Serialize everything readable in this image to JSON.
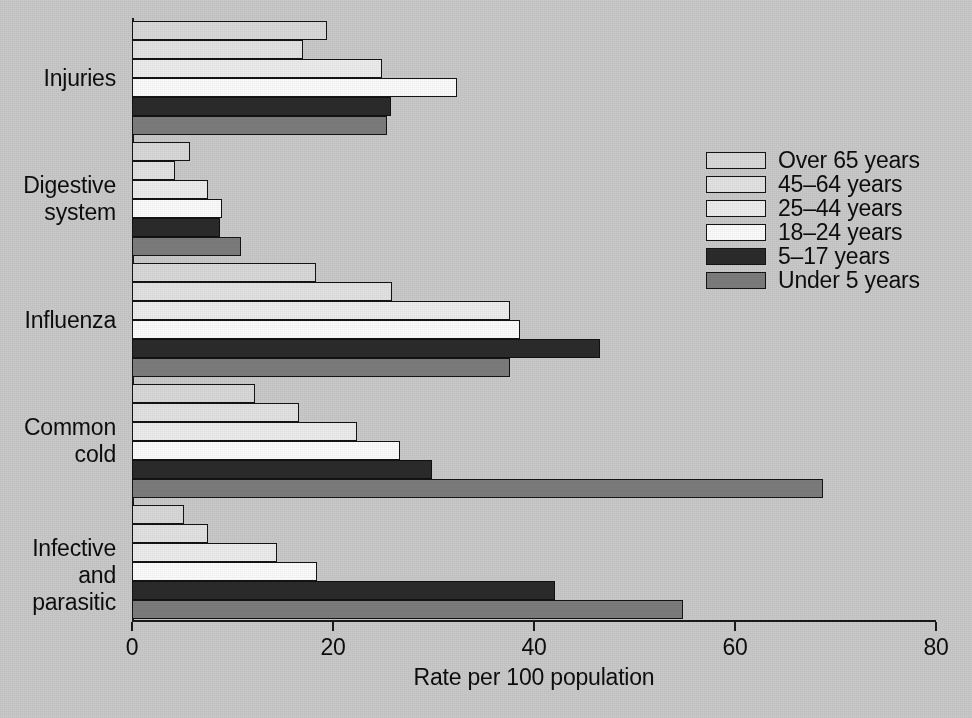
{
  "chart_data": {
    "type": "bar",
    "orientation": "horizontal",
    "title": "",
    "xlabel": "Rate per 100 population",
    "ylabel": "",
    "xlim": [
      0,
      80
    ],
    "xticks": [
      0,
      20,
      40,
      60,
      80
    ],
    "xtick_labels": [
      "0",
      "20",
      "40",
      "60",
      "80"
    ],
    "grid": false,
    "legend_position": "right",
    "categories": [
      "Injuries",
      "Digestive system",
      "Influenza",
      "Common cold",
      "Infective and parasitic"
    ],
    "category_label_lines": [
      [
        "Injuries"
      ],
      [
        "Digestive",
        "system"
      ],
      [
        "Influenza"
      ],
      [
        "Common",
        "cold"
      ],
      [
        "Infective and",
        "parasitic"
      ]
    ],
    "series": [
      {
        "name": "Over 65 years",
        "color": "#d8d8d8",
        "values": [
          19.4,
          5.8,
          18.3,
          12.2,
          5.2
        ]
      },
      {
        "name": "45–64 years",
        "color": "#e2e2e2",
        "values": [
          17.0,
          4.3,
          25.9,
          16.6,
          7.6
        ]
      },
      {
        "name": "25–44 years",
        "color": "#ececec",
        "values": [
          24.9,
          7.6,
          37.6,
          22.4,
          14.4
        ]
      },
      {
        "name": "18–24 years",
        "color": "#fbfbfb",
        "values": [
          32.3,
          9.0,
          38.6,
          26.7,
          18.4
        ]
      },
      {
        "name": "5–17 years",
        "color": "#2b2b2b",
        "values": [
          25.8,
          8.8,
          46.6,
          29.9,
          42.1
        ]
      },
      {
        "name": "Under 5 years",
        "color": "#7c7c7c",
        "values": [
          25.4,
          10.8,
          37.6,
          68.8,
          54.8
        ]
      }
    ]
  },
  "legend": {
    "items": [
      {
        "label": "Over 65 years",
        "swatch": "sw-over65"
      },
      {
        "label": "45–64 years",
        "swatch": "sw-45_64"
      },
      {
        "label": "25–44 years",
        "swatch": "sw-25_44"
      },
      {
        "label": "18–24 years",
        "swatch": "sw-18_24"
      },
      {
        "label": "5–17 years",
        "swatch": "sw-5_17"
      },
      {
        "label": "Under 5 years",
        "swatch": "sw-under5"
      }
    ]
  },
  "colors": {
    "background": "#c9c9c9",
    "axis": "#1a1a1a",
    "text": "#0d0d0d"
  }
}
